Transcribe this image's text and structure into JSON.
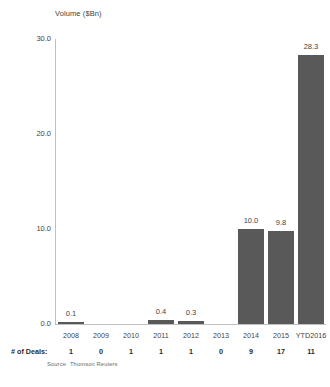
{
  "chart_data": {
    "type": "bar",
    "title": "",
    "ylabel": "Volume ($Bn)",
    "xlabel": "",
    "categories": [
      "2008",
      "2009",
      "2010",
      "2011",
      "2012",
      "2013",
      "2014",
      "2015",
      "YTD2016"
    ],
    "values": [
      0.1,
      0.0,
      0.0,
      0.4,
      0.3,
      0.0,
      10.0,
      9.8,
      28.3
    ],
    "value_labels": [
      "0.1",
      "",
      "",
      "0.4",
      "0.3",
      "",
      "10.0",
      "9.8",
      "28.3"
    ],
    "ylim": [
      0.0,
      30.0
    ],
    "yticks": [
      0.0,
      10.0,
      20.0,
      30.0
    ],
    "ytick_labels": [
      "0.0",
      "10.0",
      "20.0",
      "30.0"
    ],
    "grid": false,
    "legend": false,
    "bar_color": "#595959",
    "axis_color": "#bfbfbf",
    "series": [
      {
        "name": "Volume ($Bn)",
        "values": [
          0.1,
          0.0,
          0.0,
          0.4,
          0.3,
          0.0,
          10.0,
          9.8,
          28.3
        ]
      }
    ],
    "secondary_row": {
      "label": "# of Deals:",
      "values": [
        "1",
        "0",
        "1",
        "1",
        "1",
        "0",
        "9",
        "17",
        "11"
      ]
    }
  },
  "source": {
    "label": "Source",
    "text": "Thomson Reuters"
  }
}
